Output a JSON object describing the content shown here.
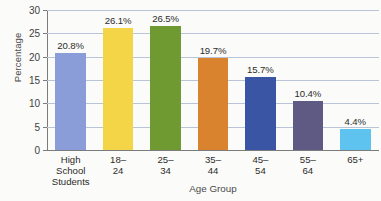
{
  "chart_data": {
    "type": "bar",
    "title": "",
    "xlabel": "Age Group",
    "ylabel": "Percentage",
    "categories": [
      "High School\nStudents",
      "18–24",
      "25–34",
      "35–44",
      "45–54",
      "55–64",
      "65+"
    ],
    "values": [
      20.8,
      26.1,
      26.5,
      19.7,
      15.7,
      10.4,
      4.4
    ],
    "value_labels": [
      "20.8%",
      "26.1%",
      "26.5%",
      "19.7%",
      "15.7%",
      "10.4%",
      "4.4%"
    ],
    "bar_colors": [
      "#8b9dd8",
      "#f4d548",
      "#6e9a31",
      "#d9832f",
      "#3a55a4",
      "#5e5a84",
      "#5fc3ef"
    ],
    "ylim": [
      0,
      30
    ],
    "yticks": [
      0,
      5,
      10,
      15,
      20,
      25,
      30
    ],
    "ytick_labels": [
      "0",
      "5",
      "10",
      "15",
      "20",
      "25",
      "30"
    ],
    "grid": true,
    "legend": "none",
    "gridline_color": "#b9c4d8",
    "axis_color": "#7b7b7b",
    "background": "#fbfbf9"
  }
}
